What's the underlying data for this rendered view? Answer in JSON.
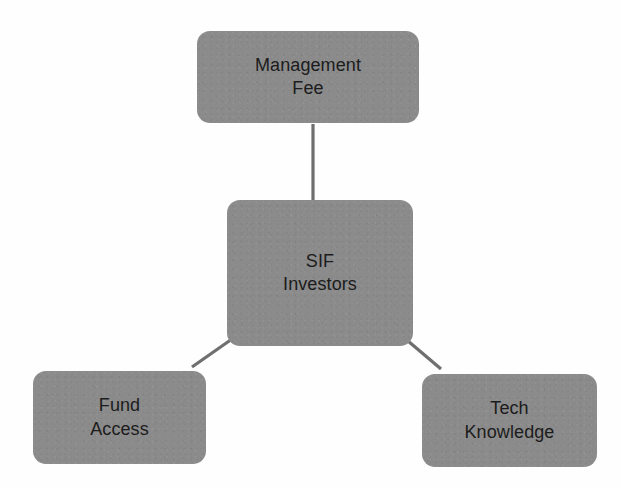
{
  "diagram": {
    "type": "hub-and-spoke",
    "background_color": "#fefefe",
    "node_fill_color": "#8b8b8b",
    "node_text_color": "#1c1c1c",
    "connector_color": "#6f6f6f",
    "nodes": [
      {
        "id": "management-fee",
        "label": "Management\nFee",
        "line1": "Management",
        "line2": "Fee",
        "role": "satellite",
        "position": "top"
      },
      {
        "id": "sif-investors",
        "label": "SIF\nInvestors",
        "line1": "SIF",
        "line2": "Investors",
        "role": "hub",
        "position": "center"
      },
      {
        "id": "fund-access",
        "label": "Fund\nAccess",
        "line1": "Fund",
        "line2": "Access",
        "role": "satellite",
        "position": "bottom-left"
      },
      {
        "id": "tech-knowledge",
        "label": "Tech\nKnowledge",
        "line1": "Tech",
        "line2": "Knowledge",
        "role": "satellite",
        "position": "bottom-right"
      }
    ],
    "connectors": [
      {
        "id": "hub-to-management-fee",
        "from": "sif-investors",
        "to": "management-fee",
        "style": "straight-vertical"
      },
      {
        "id": "hub-to-fund-access",
        "from": "sif-investors",
        "to": "fund-access",
        "style": "straight-diagonal"
      },
      {
        "id": "hub-to-tech-knowledge",
        "from": "sif-investors",
        "to": "tech-knowledge",
        "style": "straight-diagonal"
      }
    ]
  }
}
